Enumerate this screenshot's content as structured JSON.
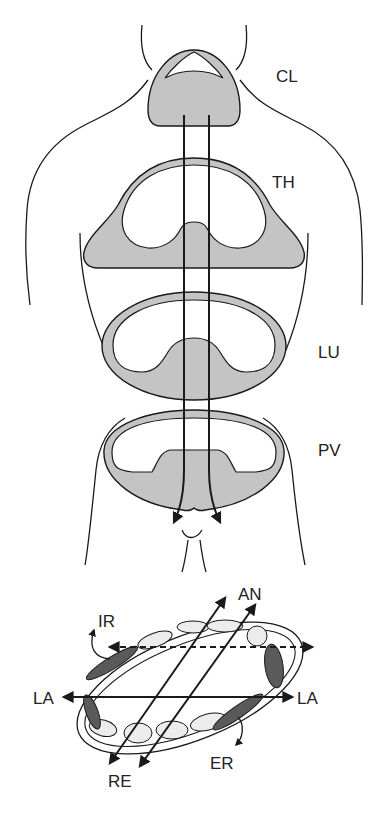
{
  "figure": {
    "body_sections": {
      "cervical": "CL",
      "thoracic": "TH",
      "lumbar": "LU",
      "pelvic": "PV"
    },
    "rotation_diagram": {
      "anterior": "AN",
      "retro": "RE",
      "lateral_left": "LA",
      "lateral_right": "LA",
      "internal_rotation": "IR",
      "external_rotation": "ER"
    },
    "colors": {
      "section_fill": "#c4c4c4",
      "dark_fill": "#5a5a5a",
      "light_fill": "#ececec",
      "line": "#1a1a1a"
    }
  }
}
